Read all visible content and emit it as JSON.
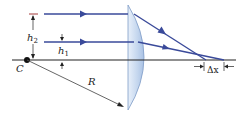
{
  "diagram": {
    "type": "spherical-aberration-lens",
    "labels": {
      "center": "C",
      "radius": "R",
      "height_large": "h",
      "height_large_sub": "2",
      "height_small": "h",
      "height_small_sub": "1",
      "delta": "Δx"
    },
    "colors": {
      "ray": "#3a4a9a",
      "axis": "#222222",
      "lens_fill": "#c9daf0",
      "lens_edge": "#7f9cc7",
      "radius_line": "#555555",
      "dim_marker": "#a33a3a"
    },
    "rays": [
      {
        "name": "outer-ray",
        "height_label": "h2"
      },
      {
        "name": "inner-ray",
        "height_label": "h1"
      }
    ]
  }
}
